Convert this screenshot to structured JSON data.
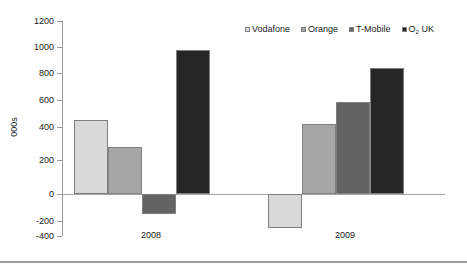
{
  "chart_data": {
    "type": "bar",
    "title": "",
    "subtitle": "",
    "xlabel": "",
    "ylabel": "000s",
    "categories": [
      "2008",
      "2009"
    ],
    "series": [
      {
        "name": "Vodafone",
        "values": [
          560,
          -255
        ],
        "color": "#d9d9d9"
      },
      {
        "name": "Orange",
        "values": [
          355,
          530
        ],
        "color": "#a6a6a6"
      },
      {
        "name": "T-Mobile",
        "values": [
          -150,
          695
        ],
        "color": "#636363"
      },
      {
        "name": "O2 UK",
        "values": [
          1085,
          945
        ],
        "color": "#262626"
      }
    ],
    "ylim": [
      -400,
      1200
    ],
    "ytick_step": 200,
    "yticks": [
      "1200",
      "1000",
      "800",
      "600",
      "400",
      "200",
      "0",
      "-200",
      "-400"
    ],
    "grid": false,
    "legend_position": "top-right",
    "annotations": []
  },
  "legend": {
    "items": [
      {
        "label": "Vodafone",
        "sub": ""
      },
      {
        "label": "Orange",
        "sub": ""
      },
      {
        "label": "T-Mobile",
        "sub": ""
      },
      {
        "label": "O",
        "sub": "2",
        "suffix": " UK"
      }
    ]
  },
  "axis": {
    "y_title": "000s",
    "ticks": [
      "1200",
      "1000",
      "800",
      "600",
      "400",
      "200",
      "0",
      "-200",
      "-400"
    ],
    "category_labels": [
      "2008",
      "2009"
    ]
  }
}
